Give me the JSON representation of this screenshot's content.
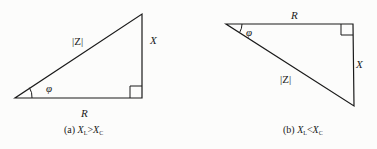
{
  "figure": {
    "panels": [
      {
        "id": "a",
        "labels": {
          "hypotenuse": "|Z|",
          "vertical": "X",
          "horizontal": "R",
          "angle": "φ"
        },
        "caption": {
          "prefix": "(a)",
          "left_var": "X",
          "left_sub": "L",
          "relation": ">",
          "right_var": "X",
          "right_sub": "C"
        }
      },
      {
        "id": "b",
        "labels": {
          "hypotenuse": "|Z|",
          "vertical": "X",
          "horizontal": "R",
          "angle": "φ"
        },
        "caption": {
          "prefix": "(b)",
          "left_var": "X",
          "left_sub": "L",
          "relation": "<",
          "right_var": "X",
          "right_sub": "C"
        }
      }
    ],
    "colors": {
      "line": "#1a1a1a",
      "background": "#fcfcfb"
    }
  }
}
